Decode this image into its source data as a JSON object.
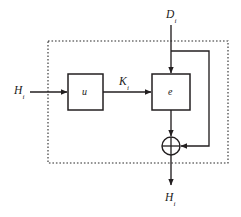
{
  "diagram": {
    "colors": {
      "background": "#ffffff",
      "stroke": "#231f20",
      "dotted_border": "#2b2b2b",
      "text": "#1a1a1a"
    },
    "blocks": [
      {
        "id": "u",
        "label": "u",
        "sub": "",
        "x": 68,
        "y": 74,
        "w": 35,
        "h": 36
      },
      {
        "id": "e",
        "label": "e",
        "sub": "",
        "x": 152,
        "y": 74,
        "w": 38,
        "h": 36
      }
    ],
    "operators": [
      {
        "id": "xor",
        "label": "xor-gate",
        "symbol": "+",
        "cx": 171,
        "cy": 146,
        "r": 9
      }
    ],
    "signals": [
      {
        "id": "h-in",
        "base": "H",
        "sub": "i",
        "x": 14,
        "y": 85
      },
      {
        "id": "k",
        "base": "K",
        "sub": "i",
        "x": 119,
        "y": 76
      },
      {
        "id": "d-in",
        "base": "D",
        "sub": "i",
        "x": 166,
        "y": 9
      },
      {
        "id": "h-out",
        "base": "H",
        "sub": "i",
        "x": 165,
        "y": 192
      }
    ],
    "boundary": {
      "x": 48,
      "y": 41,
      "w": 180,
      "h": 122,
      "style": "dotted"
    }
  }
}
